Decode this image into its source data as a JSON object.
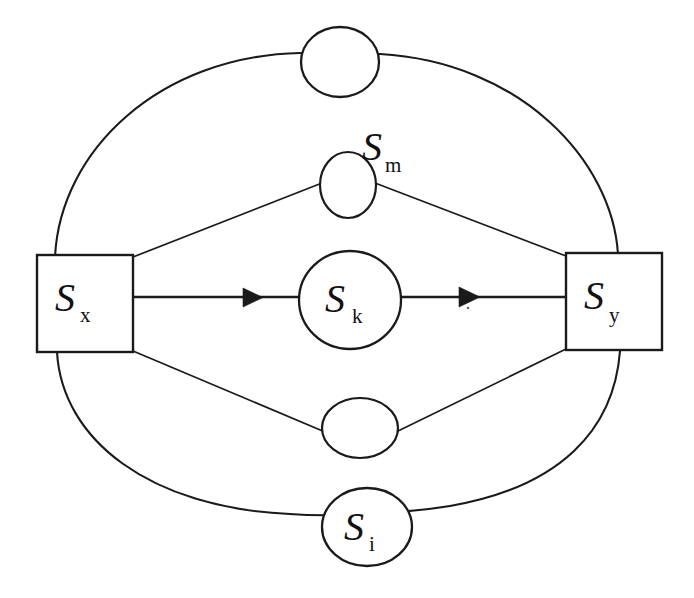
{
  "diagram": {
    "background_color": "#ffffff",
    "stroke_color": "#1a1a1a",
    "nodes": [
      {
        "id": "top-empty-circle",
        "kind": "circle",
        "label": "",
        "subscript": "",
        "cx": 340,
        "cy": 62,
        "rx": 39,
        "ry": 35
      },
      {
        "id": "node-sm",
        "kind": "circle",
        "label": "S",
        "subscript": "m",
        "cx": 348,
        "cy": 185,
        "rx": 28,
        "ry": 33,
        "label_x": 362,
        "label_y": 160,
        "sub_x": 385,
        "sub_y": 172
      },
      {
        "id": "node-sk",
        "kind": "circle",
        "label": "S",
        "subscript": "k",
        "cx": 350,
        "cy": 300,
        "rx": 51,
        "ry": 49,
        "label_x": 325,
        "label_y": 312,
        "sub_x": 352,
        "sub_y": 323
      },
      {
        "id": "lower-empty-circle",
        "kind": "circle",
        "label": "",
        "subscript": "",
        "cx": 360,
        "cy": 428,
        "rx": 38,
        "ry": 30
      },
      {
        "id": "node-si",
        "kind": "circle",
        "label": "S",
        "subscript": "i",
        "cx": 367,
        "cy": 527,
        "rx": 45,
        "ry": 39,
        "label_x": 344,
        "label_y": 540,
        "sub_x": 369,
        "sub_y": 551
      },
      {
        "id": "node-sx",
        "kind": "square",
        "label": "S",
        "subscript": "x",
        "x": 37,
        "y": 255,
        "width": 96,
        "height": 97,
        "label_x": 55,
        "label_y": 311,
        "sub_x": 80,
        "sub_y": 322
      },
      {
        "id": "node-sy",
        "kind": "square",
        "label": "S",
        "subscript": "y",
        "x": 566,
        "y": 253,
        "width": 96,
        "height": 97,
        "label_x": 584,
        "label_y": 309,
        "sub_x": 609,
        "sub_y": 322
      }
    ],
    "edges": [
      {
        "id": "edge-sx-sk",
        "from": "node-sx",
        "to": "node-sk",
        "style": "arrow",
        "direction": "forward"
      },
      {
        "id": "edge-sk-sy",
        "from": "node-sk",
        "to": "node-sy",
        "style": "arrow",
        "direction": "forward"
      },
      {
        "id": "edge-sx-sm",
        "from": "node-sx",
        "to": "node-sm",
        "style": "line",
        "direction": "none"
      },
      {
        "id": "edge-sm-sy",
        "from": "node-sm",
        "to": "node-sy",
        "style": "line",
        "direction": "none"
      },
      {
        "id": "edge-sx-lower",
        "from": "node-sx",
        "to": "lower-empty-circle",
        "style": "line",
        "direction": "none"
      },
      {
        "id": "edge-lower-sy",
        "from": "lower-empty-circle",
        "to": "node-sy",
        "style": "line",
        "direction": "none"
      },
      {
        "id": "edge-ring-top",
        "from": "node-sx",
        "to": "node-sy",
        "style": "curve",
        "direction": "none",
        "passes_through": "top-empty-circle"
      },
      {
        "id": "edge-ring-bottom",
        "from": "node-sx",
        "to": "node-sy",
        "style": "curve",
        "direction": "none",
        "passes_through": "node-si"
      }
    ]
  }
}
